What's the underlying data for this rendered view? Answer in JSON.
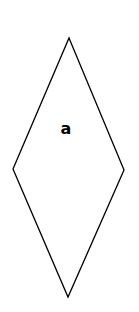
{
  "diagram": {
    "shape": "rhombus",
    "stroke_color": "#000000",
    "fill_color": "#ffffff",
    "vertices": {
      "top": [
        69,
        38
      ],
      "right": [
        124,
        170
      ],
      "bottom": [
        68,
        297
      ],
      "left": [
        13,
        169
      ]
    },
    "label": {
      "text": "a",
      "x": 66,
      "y": 134
    }
  }
}
